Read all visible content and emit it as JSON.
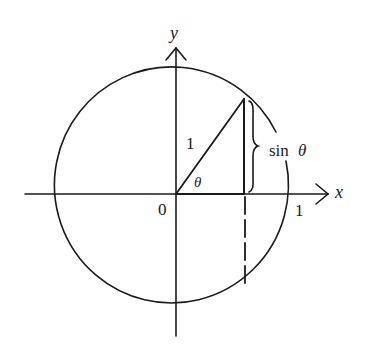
{
  "diagram": {
    "labels": {
      "y_axis": "y",
      "x_axis": "x",
      "origin": "0",
      "x_intercept": "1",
      "radius": "1",
      "angle": "θ",
      "sin_label_text": "sin",
      "sin_label_var": "θ"
    },
    "colors": {
      "ink": "#1a1a1a",
      "background": "#ffffff"
    },
    "geometry": {
      "center": [
        176,
        194
      ],
      "radius": 117,
      "point_on_circle": [
        244,
        99
      ],
      "foot_of_perpendicular": [
        244,
        194
      ],
      "dashed_projection_end": [
        244,
        288
      ]
    }
  }
}
